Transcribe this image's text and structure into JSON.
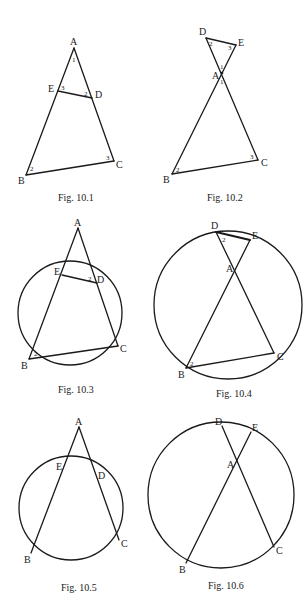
{
  "figures": [
    {
      "id": "fig-10-1",
      "caption": "Fig. 10.1",
      "points": {
        "A": [
          74,
          48
        ],
        "E": [
          58,
          91
        ],
        "D": [
          92,
          98
        ],
        "B": [
          26,
          175
        ],
        "C": [
          114,
          161
        ]
      },
      "segments": [
        [
          "A",
          "B"
        ],
        [
          "A",
          "C"
        ],
        [
          "B",
          "C"
        ],
        [
          "E",
          "D"
        ]
      ],
      "circle": null,
      "vertex_labels": {
        "A": "A",
        "B": "B",
        "C": "C",
        "D": "D",
        "E": "E"
      },
      "angle_labels": [
        {
          "text": "1",
          "at": [
            73,
            60
          ]
        },
        {
          "text": "3",
          "at": [
            62,
            93
          ]
        },
        {
          "text": "2",
          "at": [
            85,
            97
          ]
        },
        {
          "text": "2",
          "at": [
            31,
            170
          ]
        },
        {
          "text": "3",
          "at": [
            107,
            160
          ]
        }
      ]
    },
    {
      "id": "fig-10-2",
      "caption": "Fig. 10.2",
      "points": {
        "D": [
          206,
          38
        ],
        "E": [
          236,
          45
        ],
        "A": [
          222,
          73
        ],
        "B": [
          172,
          174
        ],
        "C": [
          258,
          160
        ]
      },
      "segments": [
        [
          "D",
          "C"
        ],
        [
          "E",
          "B"
        ],
        [
          "D",
          "E"
        ],
        [
          "B",
          "C"
        ]
      ],
      "circle": null,
      "vertex_labels": {
        "A": "A",
        "B": "B",
        "C": "C",
        "D": "D",
        "E": "E"
      },
      "angle_labels": [
        {
          "text": "2",
          "at": [
            210,
            45
          ]
        },
        {
          "text": "3",
          "at": [
            229,
            48
          ]
        },
        {
          "text": "1",
          "at": [
            221,
            68
          ]
        },
        {
          "text": "1",
          "at": [
            221,
            83
          ]
        },
        {
          "text": "2",
          "at": [
            177,
            171
          ]
        },
        {
          "text": "3",
          "at": [
            251,
            158
          ]
        }
      ]
    },
    {
      "id": "fig-10-3",
      "caption": "Fig. 10.3",
      "points": {
        "A": [
          78,
          228
        ],
        "E": [
          62,
          275
        ],
        "D": [
          97,
          283
        ],
        "B": [
          29,
          359
        ],
        "C": [
          118,
          346
        ]
      },
      "segments": [
        [
          "A",
          "B"
        ],
        [
          "A",
          "C"
        ],
        [
          "B",
          "C"
        ],
        [
          "E",
          "D"
        ]
      ],
      "circle": {
        "cx": 70,
        "cy": 313,
        "r": 52
      },
      "vertex_labels": {
        "A": "A",
        "B": "B",
        "C": "C",
        "D": "D",
        "E": "E"
      },
      "angle_labels": [
        {
          "text": "2",
          "at": [
            89,
            280
          ]
        },
        {
          "text": "2",
          "at": [
            35,
            354
          ]
        }
      ]
    },
    {
      "id": "fig-10-4",
      "caption": "Fig. 10.4",
      "points": {
        "D": [
          216,
          232
        ],
        "E": [
          250,
          240
        ],
        "A": [
          236,
          268
        ],
        "B": [
          186,
          368
        ],
        "C": [
          274,
          353
        ]
      },
      "segments": [
        [
          "D",
          "C"
        ],
        [
          "E",
          "B"
        ],
        [
          "D",
          "E"
        ],
        [
          "B",
          "C"
        ]
      ],
      "circle": {
        "cx": 228,
        "cy": 305,
        "r": 74
      },
      "vertex_labels": {
        "A": "A",
        "B": "B",
        "C": "C",
        "D": "D",
        "E": "E"
      },
      "angle_labels": [
        {
          "text": "2",
          "at": [
            223,
            241
          ]
        },
        {
          "text": "2",
          "at": [
            192,
            364
          ]
        }
      ]
    },
    {
      "id": "fig-10-5",
      "caption": "Fig. 10.5",
      "points": {
        "A": [
          79,
          427
        ],
        "E": [
          63,
          469
        ],
        "D": [
          98,
          476
        ],
        "B": [
          31,
          553
        ],
        "C": [
          119,
          540
        ]
      },
      "segments": [
        [
          "A",
          "B"
        ],
        [
          "A",
          "C"
        ]
      ],
      "circle": {
        "cx": 71,
        "cy": 508,
        "r": 52
      },
      "vertex_labels": {
        "A": "A",
        "B": "B",
        "C": "C",
        "D": "D",
        "E": "E"
      },
      "angle_labels": []
    },
    {
      "id": "fig-10-6",
      "caption": "Fig. 10.6",
      "points": {
        "D": [
          222,
          426
        ],
        "E": [
          251,
          432
        ],
        "A": [
          236,
          463
        ],
        "B": [
          186,
          563
        ],
        "C": [
          274,
          547
        ]
      },
      "segments": [
        [
          "D",
          "C"
        ],
        [
          "E",
          "B"
        ]
      ],
      "circle": {
        "cx": 221,
        "cy": 495,
        "r": 73
      },
      "vertex_labels": {
        "A": "A",
        "B": "B",
        "C": "C",
        "D": "D",
        "E": "E"
      },
      "angle_labels": []
    }
  ],
  "captions": {
    "fig1": "Fig. 10.1",
    "fig2": "Fig. 10.2",
    "fig3": "Fig. 10.3",
    "fig4": "Fig. 10.4",
    "fig5": "Fig. 10.5",
    "fig6": "Fig. 10.6"
  },
  "labels": {
    "A": "A",
    "B": "B",
    "C": "C",
    "D": "D",
    "E": "E",
    "one": "1",
    "two": "2",
    "three": "3"
  }
}
